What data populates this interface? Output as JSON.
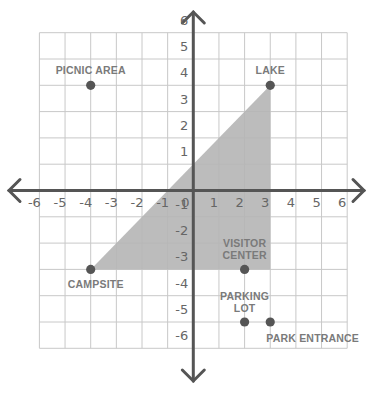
{
  "diagram": {
    "type": "coordinate-grid-map",
    "x_range": [
      -6,
      6
    ],
    "y_range": [
      -6,
      6
    ],
    "x_ticks": [
      "-6",
      "-5",
      "-4",
      "-3",
      "-2",
      "-1",
      "0",
      "1",
      "2",
      "3",
      "4",
      "5",
      "6"
    ],
    "y_ticks": [
      "6",
      "5",
      "4",
      "3",
      "2",
      "1",
      "-1",
      "-2",
      "-3",
      "-4",
      "-5",
      "-6"
    ],
    "colors": {
      "grid": "#c8c8c8",
      "axis": "#555555",
      "shade": "#b5b5b5",
      "point": "#555555",
      "label": "#7a7a7a",
      "tick": "#666666"
    },
    "shaded_triangle": [
      [
        -4,
        -3
      ],
      [
        3,
        4
      ],
      [
        3,
        -3
      ]
    ],
    "locations": [
      {
        "name": "PICNIC AREA",
        "x": -4,
        "y": 4,
        "lines": [
          "PICNIC AREA"
        ],
        "anchor": "above"
      },
      {
        "name": "LAKE",
        "x": 3,
        "y": 4,
        "lines": [
          "LAKE"
        ],
        "anchor": "above"
      },
      {
        "name": "CAMPSITE",
        "x": -4,
        "y": -3,
        "lines": [
          "CAMPSITE"
        ],
        "anchor": "below"
      },
      {
        "name": "VISITOR CENTER",
        "x": 2,
        "y": -3,
        "lines": [
          "VISITOR",
          "CENTER"
        ],
        "anchor": "above"
      },
      {
        "name": "PARKING LOT",
        "x": 2,
        "y": -5,
        "lines": [
          "PARKING",
          "LOT"
        ],
        "anchor": "above"
      },
      {
        "name": "PARK ENTRANCE",
        "x": 3,
        "y": -5,
        "lines": [
          "PARK ENTRANCE"
        ],
        "anchor": "below-right"
      }
    ]
  }
}
